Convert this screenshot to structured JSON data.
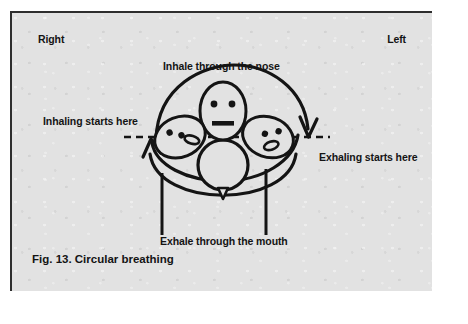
{
  "figure": {
    "caption": "Fig. 13. Circular breathing",
    "background_color": "#e2e2e2",
    "ink_color": "#141414",
    "page_color": "#ffffff"
  },
  "labels": {
    "right": "Right",
    "left": "Left",
    "inhale_nose": "Inhale through the nose",
    "inhaling_starts": "Inhaling starts here",
    "exhaling_starts": "Exhaling starts here",
    "exhale_mouth": "Exhale through the mouth"
  },
  "diagram": {
    "name": "circular-breathing-diagram",
    "elements": [
      {
        "name": "face-center-upright",
        "eyes": 2,
        "mouth": "bar"
      },
      {
        "name": "face-left-tilted",
        "eyes": 2,
        "mouth": "oval"
      },
      {
        "name": "face-right-tilted",
        "eyes": 2,
        "mouth": "oval"
      },
      {
        "name": "dashed-horizontal-axis"
      },
      {
        "name": "inhale-arc-arrow",
        "direction": "left-to-right"
      },
      {
        "name": "exhale-arc-arrow",
        "direction": "right-to-left"
      },
      {
        "name": "balloon-circle"
      },
      {
        "name": "shoulders-arc"
      },
      {
        "name": "body-line-left"
      },
      {
        "name": "body-line-right"
      }
    ]
  }
}
